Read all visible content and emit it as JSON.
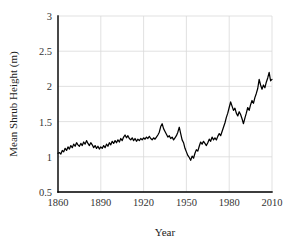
{
  "chart_data": {
    "type": "line",
    "title": "",
    "xlabel": "Year",
    "ylabel": "Mean Shrub Height (m)",
    "xlim": [
      1860,
      2010
    ],
    "ylim": [
      0.5,
      3
    ],
    "xticks": [
      1860,
      1890,
      1920,
      1950,
      1980,
      2010
    ],
    "xtick_labels": [
      "1860",
      "1890",
      "1920",
      "1950",
      "1980",
      "2010"
    ],
    "yticks": [
      0.5,
      1,
      1.5,
      2,
      2.5,
      3
    ],
    "ytick_labels": [
      "0.5",
      "1",
      "1.5",
      "2",
      "2.5",
      "3"
    ],
    "grid": true,
    "grid_axes": "both",
    "legend": false,
    "series_color": "#000000",
    "series": [
      {
        "name": "Mean Shrub Height",
        "x": [
          1860,
          1861,
          1862,
          1863,
          1864,
          1865,
          1866,
          1867,
          1868,
          1869,
          1870,
          1871,
          1872,
          1873,
          1874,
          1875,
          1876,
          1877,
          1878,
          1879,
          1880,
          1881,
          1882,
          1883,
          1884,
          1885,
          1886,
          1887,
          1888,
          1889,
          1890,
          1891,
          1892,
          1893,
          1894,
          1895,
          1896,
          1897,
          1898,
          1899,
          1900,
          1901,
          1902,
          1903,
          1904,
          1905,
          1906,
          1907,
          1908,
          1909,
          1910,
          1911,
          1912,
          1913,
          1914,
          1915,
          1916,
          1917,
          1918,
          1919,
          1920,
          1921,
          1922,
          1923,
          1924,
          1925,
          1926,
          1927,
          1928,
          1929,
          1930,
          1931,
          1932,
          1933,
          1934,
          1935,
          1936,
          1937,
          1938,
          1939,
          1940,
          1941,
          1942,
          1943,
          1944,
          1945,
          1946,
          1947,
          1948,
          1949,
          1950,
          1951,
          1952,
          1953,
          1954,
          1955,
          1956,
          1957,
          1958,
          1959,
          1960,
          1961,
          1962,
          1963,
          1964,
          1965,
          1966,
          1967,
          1968,
          1969,
          1970,
          1971,
          1972,
          1973,
          1974,
          1975,
          1976,
          1977,
          1978,
          1979,
          1980,
          1981,
          1982,
          1983,
          1984,
          1985,
          1986,
          1987,
          1988,
          1989,
          1990,
          1991,
          1992,
          1993,
          1994,
          1995,
          1996,
          1997,
          1998,
          1999,
          2000,
          2001,
          2002,
          2003,
          2004,
          2005,
          2006,
          2007,
          2008,
          2009,
          2010
        ],
        "values": [
          1.05,
          1.06,
          1.04,
          1.09,
          1.07,
          1.12,
          1.09,
          1.14,
          1.11,
          1.16,
          1.13,
          1.18,
          1.15,
          1.2,
          1.17,
          1.15,
          1.19,
          1.16,
          1.21,
          1.18,
          1.23,
          1.19,
          1.16,
          1.2,
          1.17,
          1.13,
          1.16,
          1.12,
          1.15,
          1.11,
          1.14,
          1.12,
          1.16,
          1.13,
          1.18,
          1.15,
          1.2,
          1.17,
          1.22,
          1.19,
          1.23,
          1.2,
          1.24,
          1.21,
          1.26,
          1.23,
          1.28,
          1.31,
          1.27,
          1.3,
          1.26,
          1.24,
          1.27,
          1.23,
          1.26,
          1.22,
          1.25,
          1.23,
          1.26,
          1.24,
          1.27,
          1.25,
          1.28,
          1.26,
          1.29,
          1.26,
          1.24,
          1.27,
          1.25,
          1.28,
          1.31,
          1.35,
          1.43,
          1.47,
          1.4,
          1.36,
          1.32,
          1.28,
          1.3,
          1.26,
          1.28,
          1.24,
          1.27,
          1.3,
          1.35,
          1.42,
          1.33,
          1.24,
          1.2,
          1.12,
          1.07,
          1.02,
          0.99,
          0.95,
          1.01,
          0.98,
          1.05,
          1.1,
          1.08,
          1.15,
          1.21,
          1.18,
          1.22,
          1.19,
          1.16,
          1.2,
          1.25,
          1.22,
          1.28,
          1.24,
          1.27,
          1.24,
          1.29,
          1.33,
          1.3,
          1.36,
          1.42,
          1.48,
          1.56,
          1.62,
          1.7,
          1.78,
          1.72,
          1.66,
          1.69,
          1.62,
          1.58,
          1.64,
          1.6,
          1.54,
          1.47,
          1.55,
          1.62,
          1.7,
          1.66,
          1.74,
          1.8,
          1.76,
          1.84,
          1.9,
          1.97,
          2.1,
          2.02,
          1.96,
          2.02,
          1.98,
          2.06,
          2.12,
          2.2,
          2.08,
          2.1
        ]
      }
    ]
  },
  "figure": {
    "background_color": "#ffffff",
    "axis_color": "#000000",
    "grid_color": "#d9d9d9"
  }
}
